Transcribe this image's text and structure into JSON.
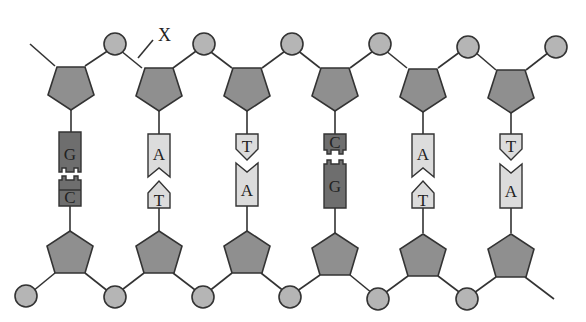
{
  "diagram": {
    "label_x": "X",
    "colors": {
      "sugar": "#8f8f8f",
      "phosphate": "#b5b5b5",
      "purine_dark": "#6e6e6e",
      "base_light": "#dcdcdc",
      "line": "#333333"
    },
    "top_strand": [
      "G",
      "A",
      "T",
      "C",
      "A",
      "T"
    ],
    "bottom_strand": [
      "C",
      "T",
      "A",
      "G",
      "T",
      "A"
    ],
    "pairs": [
      {
        "top": "G",
        "bottom": "C"
      },
      {
        "top": "A",
        "bottom": "T"
      },
      {
        "top": "T",
        "bottom": "A"
      },
      {
        "top": "C",
        "bottom": "G"
      },
      {
        "top": "A",
        "bottom": "T"
      },
      {
        "top": "T",
        "bottom": "A"
      }
    ]
  }
}
